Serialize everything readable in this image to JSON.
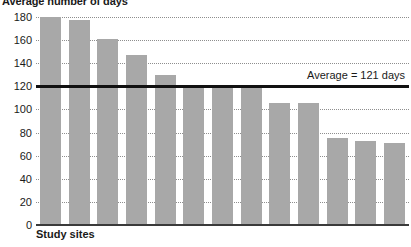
{
  "chart_data": {
    "type": "bar",
    "title": "Average number of days",
    "xlabel": "Study sites",
    "ylabel": "",
    "ylim": [
      0,
      180
    ],
    "yticks": [
      0,
      20,
      40,
      60,
      80,
      100,
      120,
      140,
      160,
      180
    ],
    "grid": true,
    "legend": "none",
    "categories": [
      "1",
      "2",
      "3",
      "4",
      "5",
      "6",
      "7",
      "8",
      "9",
      "10",
      "11",
      "12",
      "13"
    ],
    "values": [
      180,
      177,
      161,
      147,
      130,
      121,
      121,
      121,
      106,
      106,
      75,
      73,
      71
    ],
    "bar_color": "#a8a8a8",
    "annotations": [
      {
        "name": "average-line",
        "label": "Average = 121 days",
        "value": 121,
        "color": "#111111"
      }
    ]
  }
}
